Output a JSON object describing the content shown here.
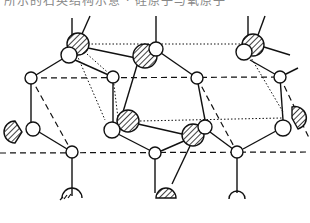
{
  "figure": {
    "caption_cutoff": "所示的石英结构示意 · 硅原子与氧原子",
    "colors": {
      "stroke": "#111111",
      "background": "#ffffff"
    },
    "atoms_hatched": [
      {
        "x": 78,
        "y": 44,
        "r": 11
      },
      {
        "x": 145,
        "y": 56,
        "r": 12
      },
      {
        "x": 253,
        "y": 45,
        "r": 11
      },
      {
        "x": 128,
        "y": 121,
        "r": 11
      },
      {
        "x": 193,
        "y": 135,
        "r": 11
      },
      {
        "x": 292,
        "y": 118,
        "r": 11
      },
      {
        "x": 15,
        "y": 132,
        "r": 11
      },
      {
        "x": 166,
        "y": 193,
        "r": 10
      }
    ],
    "atoms_open": [
      {
        "x": 69,
        "y": 55,
        "r": 8
      },
      {
        "x": 156,
        "y": 49,
        "r": 7
      },
      {
        "x": 244,
        "y": 52,
        "r": 8
      },
      {
        "x": 31,
        "y": 78,
        "r": 6
      },
      {
        "x": 113,
        "y": 77,
        "r": 6
      },
      {
        "x": 197,
        "y": 78,
        "r": 6
      },
      {
        "x": 280,
        "y": 77,
        "r": 6
      },
      {
        "x": 112,
        "y": 130,
        "r": 8
      },
      {
        "x": 205,
        "y": 127,
        "r": 7
      },
      {
        "x": 283,
        "y": 128,
        "r": 8
      },
      {
        "x": 33,
        "y": 129,
        "r": 7
      },
      {
        "x": 72,
        "y": 152,
        "r": 6
      },
      {
        "x": 155,
        "y": 153,
        "r": 6
      },
      {
        "x": 237,
        "y": 152,
        "r": 6
      }
    ]
  }
}
